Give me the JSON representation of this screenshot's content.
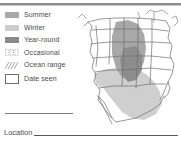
{
  "legend": {
    "items": [
      {
        "label": "Summer",
        "symbol": "filled-swatch",
        "color": "#a8a8a8"
      },
      {
        "label": "Winter",
        "symbol": "filled-swatch",
        "color": "#cccccc"
      },
      {
        "label": "Year-round",
        "symbol": "filled-swatch",
        "color": "#8a8a8a"
      },
      {
        "label": "Occasional",
        "symbol": "dotted-swatch",
        "color": "#9a9a9a"
      },
      {
        "label": "Ocean range",
        "symbol": "hatched-swatch",
        "color": "#9a9a9a"
      },
      {
        "label": "Date seen",
        "symbol": "outlined-box",
        "color": "#6d6d6d"
      }
    ]
  },
  "form": {
    "location_label": "Location",
    "location_value": ""
  },
  "map": {
    "name": "north-america-range-map",
    "regions": [
      {
        "name": "summer-range",
        "fill": "#a8a8a8"
      },
      {
        "name": "winter-range",
        "fill": "#cccccc"
      },
      {
        "name": "year-round-range",
        "fill": "#8a8a8a"
      }
    ],
    "outline_color": "#6f6f6f"
  },
  "colors": {
    "rule": "#8e8e8e",
    "text": "#4a4a4a",
    "line": "#5a5a5a"
  }
}
